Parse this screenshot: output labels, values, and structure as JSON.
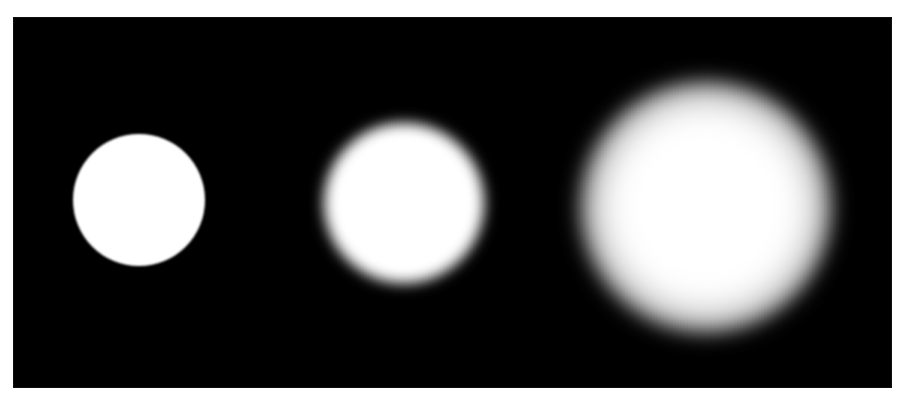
{
  "figure": {
    "width": 907,
    "height": 401,
    "page_background": "#ffffff",
    "panel": {
      "x": 13,
      "y": 17,
      "width": 879,
      "height": 371,
      "background": "#000000",
      "foreground": "#ffffff"
    }
  },
  "chart_data": {
    "type": "heatmap",
    "title": "",
    "subtitle": "",
    "xlabel": "",
    "ylabel": "",
    "legend": [],
    "annotations": [],
    "grid": false,
    "background": "#000000",
    "foreground": "#ffffff",
    "description": "Three white circular discs on a black background, left to right with progressively increasing Gaussian blur.",
    "x": [
      139,
      404,
      706
    ],
    "values": [
      1,
      7,
      28
    ],
    "categories": [
      "sharp",
      "medium blur",
      "heavy blur"
    ],
    "series": [
      {
        "name": "blur sigma (px)",
        "values": [
          1,
          7,
          28
        ]
      },
      {
        "name": "disc radius (px)",
        "values": [
          66,
          80,
          64
        ]
      },
      {
        "name": "visible extent radius (px)",
        "values": [
          67,
          94,
          130
        ]
      }
    ],
    "blobs": [
      {
        "index": 1,
        "label": "sharp",
        "center_x": 139,
        "center_y": 200,
        "radius": 66,
        "blur_px": 1,
        "peak_intensity": 255,
        "edge": "hard"
      },
      {
        "index": 2,
        "label": "medium blur",
        "center_x": 404,
        "center_y": 203,
        "radius": 80,
        "blur_px": 7,
        "peak_intensity": 255,
        "edge": "soft"
      },
      {
        "index": 3,
        "label": "heavy blur",
        "center_x": 706,
        "center_y": 207,
        "radius": 64,
        "blur_px": 28,
        "peak_intensity": 255,
        "edge": "very soft"
      }
    ],
    "xlim": [
      0,
      907
    ],
    "ylim": [
      0,
      401
    ]
  }
}
